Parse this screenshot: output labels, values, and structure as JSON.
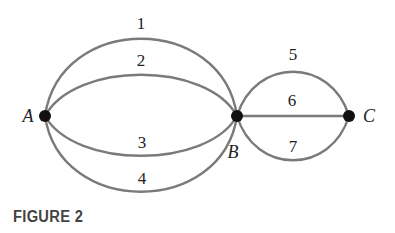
{
  "figure": {
    "caption": "FIGURE 2",
    "colors": {
      "edge": "#7a7a7a",
      "vertex": "#111111",
      "text": "#222222",
      "caption": "#444444"
    },
    "vertices": [
      {
        "id": "A",
        "label": "A",
        "x": 45,
        "y": 116
      },
      {
        "id": "B",
        "label": "B",
        "x": 237,
        "y": 116
      },
      {
        "id": "C",
        "label": "C",
        "x": 349,
        "y": 116
      }
    ],
    "edges": [
      {
        "label": "1",
        "from": "A",
        "to": "B"
      },
      {
        "label": "2",
        "from": "A",
        "to": "B"
      },
      {
        "label": "3",
        "from": "A",
        "to": "B"
      },
      {
        "label": "4",
        "from": "A",
        "to": "B"
      },
      {
        "label": "5",
        "from": "B",
        "to": "C"
      },
      {
        "label": "6",
        "from": "B",
        "to": "C"
      },
      {
        "label": "7",
        "from": "B",
        "to": "C"
      }
    ]
  }
}
